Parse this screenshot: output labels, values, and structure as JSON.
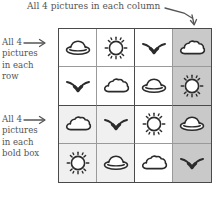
{
  "captions": {
    "column": {
      "text": "All 4 pictures in each column",
      "leader_icon": "down-arrow-icon"
    },
    "row": {
      "line1": "All 4",
      "line2": "pictures",
      "line3": "in each",
      "line4": "row",
      "arrow_icon": "right-arrow-icon"
    },
    "box": {
      "line1": "All 4",
      "line2": "pictures",
      "line3": "in each",
      "line4": "bold box",
      "arrow_icon": "right-arrow-icon"
    }
  },
  "colors": {
    "ink": "#3a3a3a",
    "grid_line": "#4a4a4a",
    "thin_line": "#9a9a9a",
    "column_shade": "#c9c9c9",
    "box_shade": "#f0f0f0"
  },
  "puzzle": {
    "size": 4,
    "symbols": [
      "ufo",
      "sun",
      "bird",
      "cloud"
    ],
    "shaded_column_index": 3,
    "shaded_box": {
      "row_start": 2,
      "col_start": 0
    },
    "bold_box_size": 2,
    "grid": [
      [
        "ufo",
        "sun",
        "bird",
        "cloud"
      ],
      [
        "bird",
        "cloud",
        "ufo",
        "sun"
      ],
      [
        "cloud",
        "bird",
        "sun",
        "ufo"
      ],
      [
        "sun",
        "ufo",
        "cloud",
        "bird"
      ]
    ]
  }
}
